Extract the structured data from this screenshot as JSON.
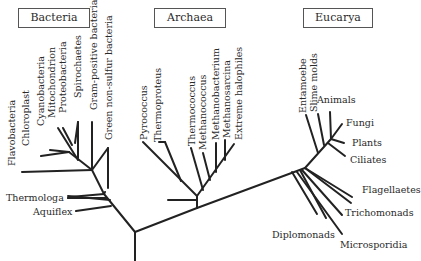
{
  "domains": {
    "bacteria": "Bacteria",
    "archaea": "Archaea",
    "eucarya": "Eucarya"
  },
  "bacteria_taxa": {
    "flavobacteria": "Flavobacteria",
    "chloroplast": "Chloroplast",
    "cyanobacteria": "Cyanobacteria",
    "mitochondrion": "Mitochondrion",
    "proteobacteria": "Proteobacteria",
    "spirochaetes": "Spirochaetes",
    "gram_positive": "Gram-positive bacteria",
    "green_non_sulfur": "Green non-sulfur bacteria",
    "thermologa": "Thermologa",
    "aquiflex": "Aquiflex"
  },
  "archaea_taxa": {
    "pyrococcus": "Pyrococcus",
    "thermoproteus": "Thermoproteus",
    "thermococcus": "Thermococcus",
    "methanococcus": "Methanococcus",
    "methanobacterium": "Methanobacterium",
    "methanosarcina": "Methanosarcina",
    "extreme_halophiles": "Extreme halophiles"
  },
  "eucarya_taxa": {
    "entamoebe": "Entamoebe",
    "slime_molds": "Slime molds",
    "animals": "Animals",
    "fungi": "Fungi",
    "plants": "Plants",
    "ciliates": "Ciliates",
    "flagellaetes": "Flagellaetes",
    "trichomonads": "Trichomonads",
    "diplomonads": "Diplomonads",
    "microsporidia": "Microsporidia"
  },
  "colors": {
    "line": "#222222",
    "text": "#2a2a2a",
    "box_border": "#555555"
  }
}
